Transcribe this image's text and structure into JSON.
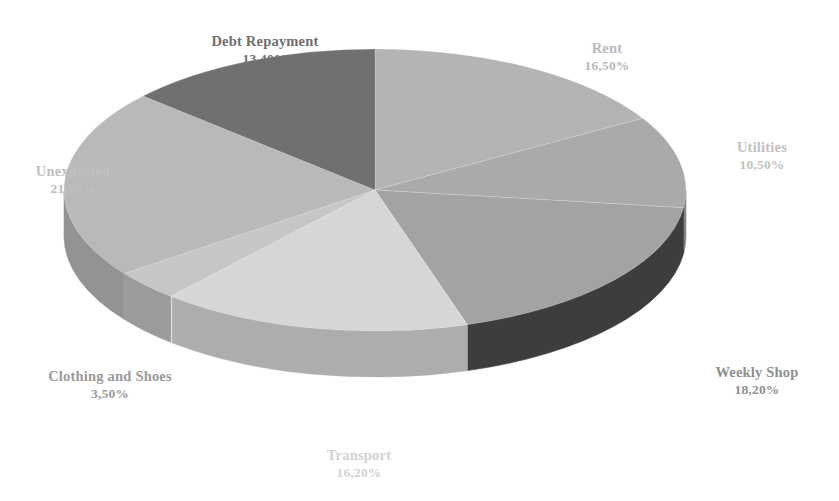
{
  "chart_data": {
    "type": "pie",
    "title": "",
    "subtitle": "",
    "xlabel": "",
    "ylabel": "",
    "legend_position": "none",
    "grid": false,
    "three_d": true,
    "decimal_separator": ",",
    "value_suffix": "%",
    "total": 100.0,
    "categories": [
      "Rent",
      "Utilities",
      "Weekly Shop",
      "Transport",
      "Clothing and Shoes",
      "Unexpected",
      "Debt Repayment"
    ],
    "values": [
      16.5,
      10.5,
      18.2,
      16.2,
      3.5,
      21.7,
      13.4
    ],
    "value_labels": [
      "16,50%",
      "10,50%",
      "18,20%",
      "16,20%",
      "3,50%",
      "21,70%",
      "13,40%"
    ],
    "slices": [
      {
        "name": "Rent",
        "value": 16.5,
        "value_label": "16,50%",
        "top_color": "#b4b4b4",
        "side_color": "#8e8e8e",
        "label_color": "#b9b9b9",
        "label_x": 607,
        "label_y": 40
      },
      {
        "name": "Utilities",
        "value": 10.5,
        "value_label": "10,50%",
        "top_color": "#aaaaaa",
        "side_color": "#858585",
        "label_color": "#c2c2c2",
        "label_x": 762,
        "label_y": 139
      },
      {
        "name": "Weekly Shop",
        "value": 18.2,
        "value_label": "18,20%",
        "top_color": "#a3a3a3",
        "side_color": "#3d3d3d",
        "label_color": "#8f8f8f",
        "label_x": 757,
        "label_y": 364
      },
      {
        "name": "Transport",
        "value": 16.2,
        "value_label": "16,20%",
        "top_color": "#d6d6d6",
        "side_color": "#adadad",
        "label_color": "#d2d2d2",
        "label_x": 359,
        "label_y": 447
      },
      {
        "name": "Clothing and Shoes",
        "value": 3.5,
        "value_label": "3,50%",
        "top_color": "#c6c6c6",
        "side_color": "#9b9b9b",
        "label_color": "#9a9a9a",
        "label_x": 110,
        "label_y": 368
      },
      {
        "name": "Unexpected",
        "value": 21.7,
        "value_label": "21,70%",
        "top_color": "#b9b9b9",
        "side_color": "#939393",
        "label_color": "#c0c0c0",
        "label_x": 73,
        "label_y": 163
      },
      {
        "name": "Debt Repayment",
        "value": 13.4,
        "value_label": "13,40%",
        "top_color": "#707070",
        "side_color": "#5c5c5c",
        "label_color": "#6f6f6f",
        "label_x": 265,
        "label_y": 33
      }
    ],
    "geometry": {
      "center_x": 375,
      "center_y": 190,
      "radius_x": 311,
      "radius_y": 141,
      "depth": 46,
      "start_angle_deg": -90
    },
    "background_color": "#ffffff"
  }
}
